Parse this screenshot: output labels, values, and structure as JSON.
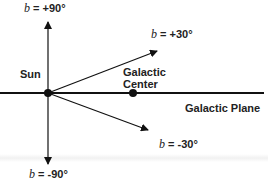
{
  "diagram": {
    "origin_label": "Sun",
    "center_label_line1": "Galactic",
    "center_label_line2": "Center",
    "plane_label": "Galactic Plane",
    "latitude_symbol": "b",
    "directions": [
      {
        "id": "up",
        "value": "= +90°"
      },
      {
        "id": "plus30",
        "value": "= +30°"
      },
      {
        "id": "minus30",
        "value": "= -30°"
      },
      {
        "id": "down",
        "value": "= -90°"
      }
    ],
    "colors": {
      "line": "#111111",
      "text": "#222222",
      "background": "#ffffff"
    }
  }
}
